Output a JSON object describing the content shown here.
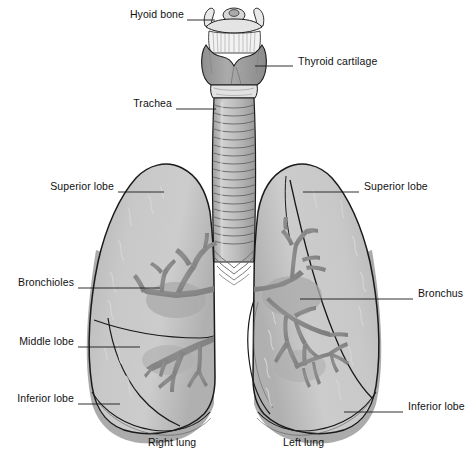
{
  "figure": {
    "background_color": "#ffffff",
    "line_color": "#1a1a1a"
  },
  "palette": {
    "lung_fill_light": "#c9c9c9",
    "lung_fill_mid": "#b8b8b8",
    "lung_fill_dark": "#a8a8a8",
    "lung_shadow": "#9a9a9a",
    "bronchi_fill": "#8a8a8a",
    "trachea_fill": "#b5b5b5",
    "trachea_ring": "#9f9f9f",
    "cartilage_fill": "#9b9b9b",
    "bone_fill": "#e8e8e8",
    "outline": "#1a1a1a",
    "label_text": "#111111",
    "leader_line": "#1a1a1a"
  },
  "labels": [
    {
      "id": "hyoid-bone",
      "text": "Hyoid bone",
      "side": "left",
      "text_x": 122,
      "text_y": 14,
      "leader_x1": 187,
      "leader_y1": 20,
      "leader_x2": 215,
      "leader_y2": 20
    },
    {
      "id": "thyroid-cartilage",
      "text": "Thyroid cartilage",
      "side": "right",
      "text_x": 298,
      "text_y": 61,
      "leader_x1": 255,
      "leader_y1": 66,
      "leader_x2": 293,
      "leader_y2": 66
    },
    {
      "id": "trachea",
      "text": "Trachea",
      "side": "left",
      "text_x": 126,
      "text_y": 103,
      "leader_x1": 176,
      "leader_y1": 109,
      "leader_x2": 216,
      "leader_y2": 109
    },
    {
      "id": "superior-lobe-right",
      "text": "Superior lobe",
      "side": "left",
      "text_x": 48,
      "text_y": 186,
      "leader_x1": 118,
      "leader_y1": 192,
      "leader_x2": 164,
      "leader_y2": 192
    },
    {
      "id": "superior-lobe-left",
      "text": "Superior lobe",
      "side": "right",
      "text_x": 364,
      "text_y": 186,
      "leader_x1": 303,
      "leader_y1": 192,
      "leader_x2": 359,
      "leader_y2": 192
    },
    {
      "id": "bronchioles",
      "text": "Bronchioles",
      "side": "left",
      "text_x": 12,
      "text_y": 282,
      "leader_x1": 78,
      "leader_y1": 288,
      "leader_x2": 160,
      "leader_y2": 288
    },
    {
      "id": "bronchus",
      "text": "Bronchus",
      "side": "right",
      "text_x": 418,
      "text_y": 293,
      "leader_x1": 300,
      "leader_y1": 299,
      "leader_x2": 413,
      "leader_y2": 299
    },
    {
      "id": "middle-lobe",
      "text": "Middle lobe",
      "side": "left",
      "text_x": 12,
      "text_y": 341,
      "leader_x1": 78,
      "leader_y1": 347,
      "leader_x2": 140,
      "leader_y2": 347
    },
    {
      "id": "inferior-lobe-right",
      "text": "Inferior lobe",
      "side": "left",
      "text_x": 12,
      "text_y": 398,
      "leader_x1": 78,
      "leader_y1": 404,
      "leader_x2": 120,
      "leader_y2": 404
    },
    {
      "id": "inferior-lobe-left",
      "text": "Inferior lobe",
      "side": "right",
      "text_x": 408,
      "text_y": 406,
      "leader_x1": 344,
      "leader_y1": 412,
      "leader_x2": 403,
      "leader_y2": 412
    }
  ],
  "captions": [
    {
      "id": "right-lung-caption",
      "text": "Right lung",
      "text_x": 148,
      "text_y": 442
    },
    {
      "id": "left-lung-caption",
      "text": "Left lung",
      "text_x": 283,
      "text_y": 442
    }
  ]
}
